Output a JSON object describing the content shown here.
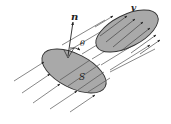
{
  "diagram": {
    "labels": {
      "normal": "n",
      "angle": "θ",
      "surface": "S",
      "velocity": "v"
    },
    "colors": {
      "surface_fill": "#a9a9a9",
      "stroke": "#333333",
      "background": "#ffffff"
    },
    "elements": [
      {
        "type": "ellipse",
        "name": "surface-S",
        "cx": 74,
        "cy": 71,
        "rx": 35,
        "ry": 17,
        "rotate": 27
      },
      {
        "type": "ellipse",
        "name": "projected-surface",
        "cx": 127,
        "cy": 31,
        "rx": 34,
        "ry": 16,
        "rotate": -27
      },
      {
        "type": "vector",
        "name": "normal-vector-n",
        "from": [
          68,
          56
        ],
        "to": [
          73,
          22
        ]
      },
      {
        "type": "arc",
        "name": "angle-theta"
      },
      {
        "type": "parallel-lines",
        "name": "flow-lines",
        "count": 12,
        "direction_deg": -30
      }
    ]
  }
}
